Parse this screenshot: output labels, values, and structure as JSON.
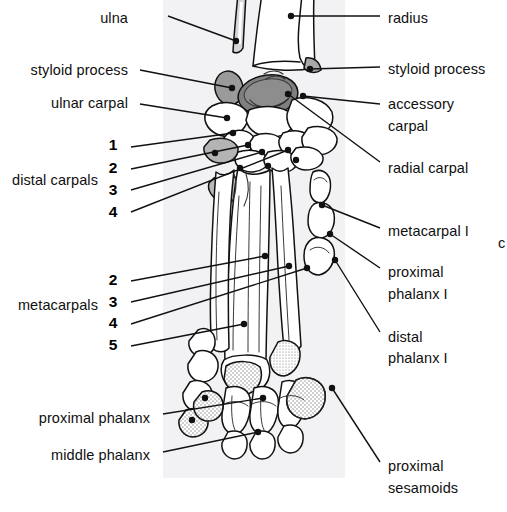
{
  "figure": {
    "panel": {
      "fill": "#f2f2f4",
      "x": 163,
      "y": 0,
      "width": 182,
      "height": 478
    },
    "bone_outline_color": "#111111",
    "bone_fill_color": "#ffffff",
    "shaded_bone_color": "#8e8e8e",
    "stipple_color": "#9a9a9a",
    "leader_color": "#111111"
  },
  "labels_left": [
    {
      "id": "ulna",
      "text": "ulna",
      "x": 128,
      "y": 18,
      "tip_x": 236,
      "tip_y": 41
    },
    {
      "id": "styloid-process",
      "text": "styloid process",
      "x": 128,
      "y": 70,
      "tip_x": 232,
      "tip_y": 88
    },
    {
      "id": "ulnar-carpal",
      "text": "ulnar carpal",
      "x": 128,
      "y": 103,
      "tip_x": 227,
      "tip_y": 118
    },
    {
      "id": "distal-carpals",
      "text": "distal carpals",
      "x": 98,
      "y": 180,
      "tip_x": null,
      "tip_y": null
    },
    {
      "id": "proximal-phalanx",
      "text": "proximal phalanx",
      "x": 150,
      "y": 418,
      "tip_x": 263,
      "tip_y": 398
    },
    {
      "id": "middle-phalanx",
      "text": "middle  phalanx",
      "x": 150,
      "y": 455,
      "tip_x": 258,
      "tip_y": 432
    },
    {
      "id": "metacarpals",
      "text": "metacarpals",
      "x": 98,
      "y": 305,
      "tip_x": null,
      "tip_y": null
    }
  ],
  "labels_right": [
    {
      "id": "radius",
      "text": "radius",
      "x": 388,
      "y": 18,
      "tip_x": 291,
      "tip_y": 16
    },
    {
      "id": "styloid-process-r",
      "text": "styloid process",
      "x": 388,
      "y": 69,
      "tip_x": 310,
      "tip_y": 69
    },
    {
      "id": "accessory",
      "text": "accessory",
      "x": 388,
      "y": 104,
      "tip_x": 303,
      "tip_y": 96
    },
    {
      "id": "accessory-carpal",
      "text": "carpal",
      "x": 388,
      "y": 126,
      "tip_x": null,
      "tip_y": null
    },
    {
      "id": "radial-carpal",
      "text": "radial carpal",
      "x": 388,
      "y": 168,
      "tip_x": 288,
      "tip_y": 94
    },
    {
      "id": "metacarpal-1",
      "text": "metacarpal I",
      "x": 388,
      "y": 231,
      "tip_x": 322,
      "tip_y": 205
    },
    {
      "id": "proximal",
      "text": "proximal",
      "x": 388,
      "y": 272,
      "tip_x": 330,
      "tip_y": 234
    },
    {
      "id": "proximal-phalanx-1",
      "text": "phalanx I",
      "x": 388,
      "y": 294,
      "tip_x": null,
      "tip_y": null
    },
    {
      "id": "distal",
      "text": "distal",
      "x": 388,
      "y": 337,
      "tip_x": 335,
      "tip_y": 260
    },
    {
      "id": "distal-phalanx-1",
      "text": "phalanx I",
      "x": 388,
      "y": 358,
      "tip_x": null,
      "tip_y": null
    },
    {
      "id": "proximal-sesamoid",
      "text": "proximal",
      "x": 388,
      "y": 466,
      "tip_x": 332,
      "tip_y": 388
    },
    {
      "id": "sesamoids",
      "text": "sesamoids",
      "x": 388,
      "y": 488,
      "tip_x": null,
      "tip_y": null
    }
  ],
  "numerals_distal_carpals": [
    {
      "text": "1",
      "x": 113,
      "y": 145,
      "tip_x": 233,
      "tip_y": 133
    },
    {
      "text": "2",
      "x": 113,
      "y": 168,
      "tip_x": 248,
      "tip_y": 145
    },
    {
      "text": "3",
      "x": 113,
      "y": 190,
      "tip_x": 262,
      "tip_y": 152
    },
    {
      "text": "4",
      "x": 113,
      "y": 212,
      "tip_x": 288,
      "tip_y": 150
    }
  ],
  "numerals_metacarpals": [
    {
      "text": "2",
      "x": 113,
      "y": 280,
      "tip_x": 265,
      "tip_y": 256
    },
    {
      "text": "3",
      "x": 113,
      "y": 302,
      "tip_x": 289,
      "tip_y": 266
    },
    {
      "text": "4",
      "x": 113,
      "y": 323,
      "tip_x": 307,
      "tip_y": 268
    },
    {
      "text": "5",
      "x": 113,
      "y": 345,
      "tip_x": 244,
      "tip_y": 324
    }
  ],
  "edge_fragment": {
    "text": "c",
    "x": 499,
    "y": 243
  }
}
